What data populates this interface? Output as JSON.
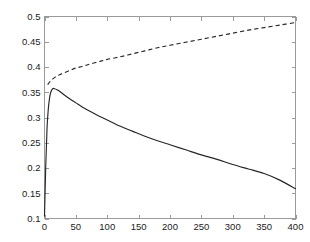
{
  "chart_data": {
    "type": "line",
    "title": "",
    "subtitle": "",
    "xlabel": "",
    "ylabel": "",
    "xlim": [
      0,
      400
    ],
    "ylim": [
      0.1,
      0.5
    ],
    "xticks": [
      0,
      50,
      100,
      150,
      200,
      250,
      300,
      350,
      400
    ],
    "yticks": [
      0.1,
      0.15,
      0.2,
      0.25,
      0.3,
      0.35,
      0.4,
      0.45,
      0.5
    ],
    "xtick_labels": [
      "0",
      "50",
      "100",
      "150",
      "200",
      "250",
      "300",
      "350",
      "400"
    ],
    "ytick_labels": [
      "0.1",
      "0.15",
      "0.2",
      "0.25",
      "0.3",
      "0.35",
      "0.4",
      "0.45",
      "0.5"
    ],
    "grid": false,
    "legend": null,
    "legend_position": "none",
    "annotations": [],
    "box": true,
    "tick_direction": "in",
    "axis_color": "#9a9a9a",
    "line_color": "#262626",
    "background_color": "#ffffff",
    "series": [
      {
        "name": "solid-curve",
        "style": "solid",
        "color": "#262626",
        "x": [
          0,
          2,
          4,
          6,
          8,
          10,
          13,
          16,
          20,
          25,
          30,
          40,
          50,
          60,
          70,
          85,
          100,
          120,
          140,
          160,
          180,
          200,
          225,
          250,
          275,
          300,
          325,
          350,
          375,
          400
        ],
        "y": [
          0.105,
          0.205,
          0.278,
          0.316,
          0.338,
          0.35,
          0.357,
          0.357,
          0.355,
          0.351,
          0.346,
          0.337,
          0.329,
          0.321,
          0.314,
          0.304,
          0.295,
          0.283,
          0.273,
          0.263,
          0.254,
          0.246,
          0.236,
          0.226,
          0.217,
          0.207,
          0.198,
          0.189,
          0.176,
          0.159
        ]
      },
      {
        "name": "dashed-curve",
        "style": "dashed",
        "color": "#262626",
        "x": [
          5,
          8,
          12,
          16,
          20,
          25,
          30,
          40,
          50,
          60,
          70,
          85,
          100,
          120,
          140,
          160,
          180,
          200,
          225,
          250,
          275,
          300,
          325,
          350,
          375,
          400
        ],
        "y": [
          0.365,
          0.37,
          0.375,
          0.379,
          0.382,
          0.385,
          0.388,
          0.393,
          0.398,
          0.401,
          0.405,
          0.41,
          0.415,
          0.42,
          0.426,
          0.432,
          0.438,
          0.443,
          0.449,
          0.455,
          0.461,
          0.467,
          0.473,
          0.478,
          0.483,
          0.488
        ]
      }
    ]
  }
}
